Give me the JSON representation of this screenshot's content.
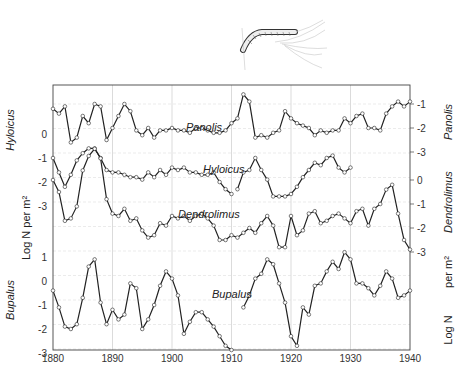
{
  "chart_data": {
    "type": "line",
    "title": "",
    "xlabel": "",
    "ylabel_left": "Log N per m²",
    "ylabel_right": "Log N per m²",
    "x_range": [
      1880,
      1940
    ],
    "x_ticks": [
      1880,
      1890,
      1900,
      1910,
      1920,
      1930,
      1940
    ],
    "grid": true,
    "illustration": "caterpillar-drawing",
    "axes": {
      "left": [
        {
          "species": "Hyloicus",
          "ticks": [
            "0",
            "-1",
            "-2",
            "-3"
          ]
        },
        {
          "species": "Bupalus",
          "ticks": [
            "1",
            "0",
            "-1",
            "-2",
            "-3"
          ]
        }
      ],
      "right": [
        {
          "species": "Panolis",
          "ticks": [
            "-1",
            "-2",
            "-3"
          ]
        },
        {
          "species": "Dendrolimus",
          "ticks": [
            "0",
            "-1",
            "-2",
            "-3"
          ]
        }
      ]
    },
    "series": [
      {
        "name": "Panolis",
        "label": "Panolis",
        "axis": "right",
        "x": [
          1880,
          1881,
          1882,
          1883,
          1884,
          1885,
          1886,
          1887,
          1888,
          1889,
          1890,
          1891,
          1892,
          1893,
          1894,
          1895,
          1896,
          1897,
          1898,
          1899,
          1900,
          1901,
          1902,
          1903,
          1904,
          1905,
          1906,
          1907,
          1908,
          1909,
          1910,
          1911,
          1912,
          1913,
          1914,
          1915,
          1916,
          1917,
          1918,
          1919,
          1920,
          1921,
          1922,
          1923,
          1924,
          1925,
          1926,
          1927,
          1928,
          1929,
          1930,
          1931,
          1932,
          1933,
          1934,
          1935,
          1936,
          1937,
          1938,
          1939,
          1940
        ],
        "values": [
          -1.2,
          -1.4,
          -1.1,
          -2.6,
          -2.4,
          -1.5,
          -1.8,
          -1.0,
          -1.1,
          -2.5,
          -2.0,
          -1.5,
          -1.0,
          -1.3,
          -2.1,
          -2.3,
          -2.0,
          -2.4,
          -2.1,
          -2.1,
          -2.0,
          -2.1,
          -2.1,
          -2.2,
          -2.0,
          -2.0,
          -2.1,
          -2.2,
          -2.2,
          -2.1,
          -1.8,
          -1.6,
          -0.6,
          -0.9,
          -2.4,
          -2.3,
          -2.4,
          -2.2,
          -2.1,
          -1.3,
          -1.6,
          -1.8,
          -1.9,
          -2.0,
          -2.3,
          -2.1,
          -2.2,
          -2.1,
          -2.1,
          -1.6,
          -1.8,
          -1.5,
          -1.4,
          -2.0,
          -2.0,
          -2.1,
          -1.4,
          -1.1,
          -0.9,
          -1.1,
          -0.9
        ]
      },
      {
        "name": "Hyloicus",
        "label": "Hyloicus",
        "axis": "left",
        "x": [
          1880,
          1881,
          1882,
          1883,
          1884,
          1885,
          1886,
          1887,
          1888,
          1889,
          1890,
          1891,
          1892,
          1893,
          1894,
          1895,
          1896,
          1897,
          1898,
          1899,
          1900,
          1901,
          1902,
          1903,
          1904,
          1905,
          1906,
          1907,
          1908,
          1909,
          1910,
          null,
          1911,
          1912,
          1913,
          1914,
          1915,
          1916,
          1917,
          1918,
          1919,
          1920,
          1921,
          1922,
          1923,
          1924,
          1925,
          1926,
          1927,
          1928,
          1929,
          1930
        ],
        "values": [
          -1.0,
          -1.6,
          -2.2,
          -1.7,
          -1.1,
          -0.8,
          -0.6,
          -0.6,
          -1.0,
          -1.5,
          -1.6,
          -1.6,
          -1.7,
          -1.8,
          -1.8,
          -1.9,
          -1.6,
          -1.8,
          -1.5,
          -1.7,
          -1.4,
          -1.5,
          -1.4,
          -1.6,
          -1.6,
          -1.7,
          -1.7,
          -1.6,
          -2.0,
          -2.3,
          -2.5,
          null,
          -2.3,
          -1.6,
          -1.5,
          -1.0,
          -1.5,
          -1.9,
          -2.6,
          -2.6,
          -2.6,
          -2.5,
          -2.2,
          -1.8,
          -1.5,
          -1.2,
          -1.3,
          -1.0,
          -0.9,
          -1.4,
          -1.6,
          -1.4
        ]
      },
      {
        "name": "Dendrolimus",
        "label": "Dendrolimus",
        "axis": "right",
        "x": [
          1880,
          1881,
          1882,
          1883,
          1884,
          1885,
          1886,
          1887,
          1888,
          1889,
          1890,
          1891,
          1892,
          1893,
          1894,
          1895,
          1896,
          1897,
          1898,
          1899,
          1900,
          1901,
          1902,
          1903,
          1904,
          1905,
          1906,
          1907,
          1908,
          1909,
          1910,
          1911,
          1912,
          1913,
          1914,
          1915,
          1916,
          1917,
          1918,
          1919,
          1920,
          1921,
          1922,
          1923,
          1924,
          1925,
          1926,
          1927,
          1928,
          1929,
          1930,
          1931,
          1932,
          1933,
          1934,
          1935,
          1936,
          1937,
          1938,
          1939,
          1940
        ],
        "values": [
          0.0,
          -0.5,
          -1.7,
          -1.6,
          -1.1,
          0.4,
          1.0,
          1.3,
          0.9,
          -0.8,
          -1.4,
          -1.5,
          -1.2,
          -1.7,
          -1.6,
          -2.1,
          -2.4,
          -2.3,
          -1.8,
          -1.9,
          -1.5,
          -1.6,
          -1.5,
          -1.7,
          -1.5,
          -1.4,
          -1.6,
          -1.9,
          -2.5,
          -2.5,
          -2.3,
          -2.4,
          -2.2,
          -2.0,
          -2.2,
          -1.8,
          -1.5,
          -1.9,
          -2.8,
          -2.8,
          -1.5,
          -2.3,
          -2.1,
          -1.4,
          -1.3,
          -1.8,
          -1.7,
          -1.5,
          -1.4,
          -1.6,
          -1.8,
          -1.3,
          -1.2,
          -1.9,
          -1.2,
          -1.0,
          -0.4,
          -0.2,
          -1.4,
          -2.5,
          -2.9
        ]
      },
      {
        "name": "Bupalus",
        "label": "Bupalus",
        "axis": "left",
        "x": [
          1880,
          1881,
          1882,
          1883,
          1884,
          1885,
          1886,
          1887,
          1888,
          1889,
          1890,
          1891,
          1892,
          1893,
          1894,
          1895,
          1896,
          1897,
          1898,
          1899,
          1900,
          1901,
          1902,
          1903,
          1904,
          1905,
          1906,
          1907,
          1908,
          1909,
          1910,
          null,
          1912,
          1913,
          1914,
          1915,
          1916,
          1917,
          1918,
          1919,
          1920,
          1921,
          1922,
          1923,
          1924,
          1925,
          1926,
          1927,
          1928,
          1929,
          1930,
          1931,
          1932,
          1933,
          1934,
          1935,
          1936,
          1937,
          1938,
          1939,
          1940
        ],
        "values": [
          -0.4,
          -1.1,
          -1.9,
          -2.0,
          -1.8,
          -0.7,
          0.6,
          0.9,
          -0.9,
          -1.8,
          -1.2,
          -1.6,
          -1.4,
          -0.1,
          -0.3,
          -2.0,
          -1.6,
          -1.0,
          -0.2,
          0.4,
          0.1,
          -0.6,
          -2.2,
          -1.7,
          -1.3,
          -1.3,
          -1.6,
          -1.9,
          -2.3,
          -2.7,
          -3.0,
          null,
          -1.1,
          -0.6,
          0.1,
          0.3,
          0.9,
          0.7,
          -0.1,
          -0.9,
          -2.3,
          -2.7,
          -1.1,
          -1.4,
          -0.2,
          -0.1,
          0.4,
          0.8,
          0.5,
          1.2,
          0.9,
          -0.1,
          -0.1,
          -0.3,
          -0.6,
          -0.2,
          0.4,
          0.1,
          -0.7,
          -0.6,
          -0.4
        ]
      }
    ]
  }
}
